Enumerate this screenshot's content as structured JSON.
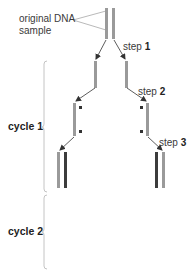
{
  "labels": {
    "original_line1": "original DNA",
    "original_line2": "sample",
    "step_word": "step",
    "step1_num": "1",
    "step2_num": "2",
    "step3_num": "3",
    "cycle1": "cycle 1",
    "cycle2": "cycle 2"
  },
  "colors": {
    "strand_light": "#9a9a9a",
    "strand_dark": "#3c3c3c",
    "arrow": "#333333",
    "bracket": "#b5b5b5",
    "primer": "#333333"
  }
}
